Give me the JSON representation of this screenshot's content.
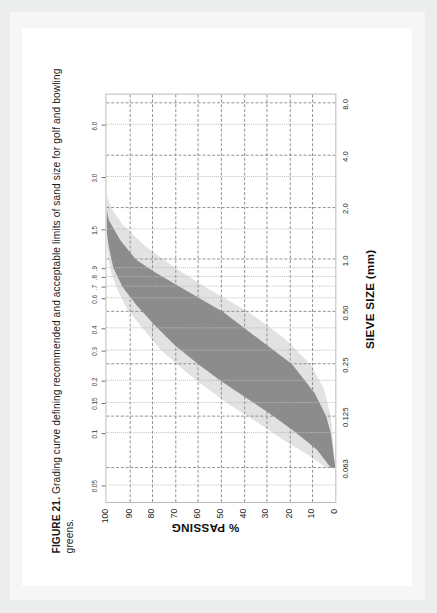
{
  "caption": {
    "figure_label": "FIGURE 21.",
    "text": " Grading curve defining recommended and acceptable limits of sand size for golf and bowling greens."
  },
  "chart_data": {
    "type": "area",
    "title": "Grading curve defining recommended and acceptable limits of sand size for golf and bowling greens",
    "xlabel": "SIEVE SIZE (mm)",
    "ylabel": "% PASSING",
    "xscale": "log",
    "xlim": [
      0.04,
      9.0
    ],
    "ylim": [
      0,
      100
    ],
    "grid": true,
    "legend": "none",
    "x_major_ticks": [
      "0.063",
      "0.125",
      "0.25",
      "0.50",
      "1.0",
      "2.0",
      "4.0",
      "8.0"
    ],
    "x_major_values": [
      0.063,
      0.125,
      0.25,
      0.5,
      1.0,
      2.0,
      4.0,
      8.0
    ],
    "x_minor_ticks": [
      "0.05",
      "0.1",
      "0.15",
      "0.2",
      "0.3",
      "0.4",
      "0.6",
      ".7",
      ".8",
      ".9",
      "1.5",
      "3.0",
      "6.0"
    ],
    "x_minor_values": [
      0.05,
      0.1,
      0.15,
      0.2,
      0.3,
      0.4,
      0.6,
      0.7,
      0.8,
      0.9,
      1.5,
      3.0,
      6.0
    ],
    "y_ticks": [
      "100",
      "90",
      "80",
      "70",
      "60",
      "50",
      "40",
      "30",
      "20",
      "10",
      "0"
    ],
    "y_values": [
      100,
      90,
      80,
      70,
      60,
      50,
      40,
      30,
      20,
      10,
      0
    ],
    "colors": {
      "recommended_band": "#8c8c8c",
      "acceptable_band": "#e2e2e2",
      "grid": "#8d8d8d",
      "frame": "#b9b9b9",
      "paper": "#ffffff",
      "scan_background": "#eceded"
    },
    "series": [
      {
        "name": "Acceptable limit - coarse (upper x)",
        "role": "acceptable_upper",
        "x": [
          0.063,
          0.09,
          0.125,
          0.18,
          0.25,
          0.35,
          0.5,
          0.7,
          0.9,
          1.2,
          1.6,
          2.0,
          2.4
        ],
        "y": [
          0,
          1,
          2,
          5,
          11,
          22,
          38,
          57,
          70,
          83,
          93,
          98,
          100
        ]
      },
      {
        "name": "Recommended limit - coarse",
        "role": "recommended_upper",
        "x": [
          0.063,
          0.1,
          0.125,
          0.17,
          0.25,
          0.33,
          0.5,
          0.7,
          0.85,
          1.0,
          1.3,
          1.7,
          2.0
        ],
        "y": [
          0,
          2,
          4,
          9,
          19,
          31,
          49,
          68,
          79,
          87,
          94,
          99,
          100
        ]
      },
      {
        "name": "Recommended limit - fine",
        "role": "recommended_lower",
        "x": [
          0.063,
          0.08,
          0.1,
          0.125,
          0.16,
          0.2,
          0.25,
          0.32,
          0.42,
          0.55,
          0.7,
          0.9,
          1.2,
          1.5
        ],
        "y": [
          2,
          8,
          17,
          27,
          39,
          50,
          60,
          70,
          79,
          87,
          93,
          97,
          99,
          100
        ]
      },
      {
        "name": "Acceptable limit - fine (lower x)",
        "role": "acceptable_lower",
        "x": [
          0.063,
          0.075,
          0.09,
          0.115,
          0.145,
          0.185,
          0.23,
          0.3,
          0.4,
          0.52,
          0.66,
          0.85,
          1.1,
          1.4
        ],
        "y": [
          4,
          12,
          22,
          34,
          46,
          57,
          66,
          76,
          84,
          91,
          95,
          98,
          99.5,
          100
        ]
      }
    ],
    "annotations": [
      "Dark grey shaded zone = recommended grading envelope",
      "Light grey shaded zone = acceptable grading envelope"
    ]
  }
}
